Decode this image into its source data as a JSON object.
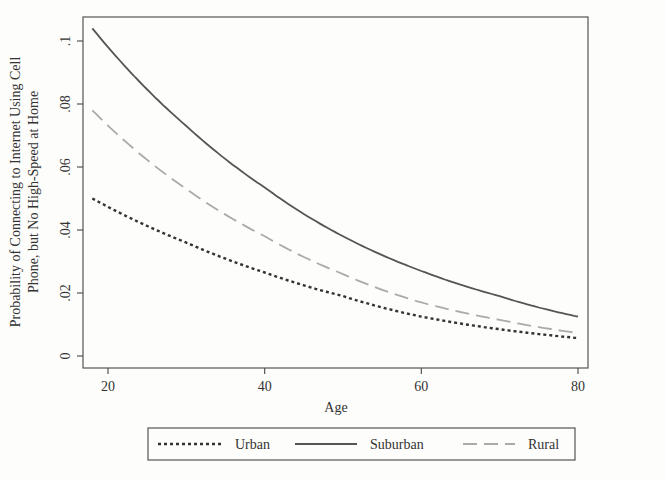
{
  "chart_data": {
    "type": "line",
    "title": "",
    "xlabel": "Age",
    "ylabel_lines": [
      "Probability of Connecting to Internet Using Cell",
      "Phone, but No High-Speed at Home"
    ],
    "ylabel": "Probability of Connecting to Internet Using Cell Phone, but No High-Speed at Home",
    "xlim": [
      18,
      80
    ],
    "ylim": [
      0,
      0.105
    ],
    "x_ticks": [
      20,
      40,
      60,
      80
    ],
    "x_tick_labels": [
      "20",
      "40",
      "60",
      "80"
    ],
    "y_ticks": [
      0,
      0.02,
      0.04,
      0.06,
      0.08,
      0.1
    ],
    "y_tick_labels": [
      "0",
      ".02",
      ".04",
      ".06",
      ".08",
      ".1"
    ],
    "grid": false,
    "legend_position": "bottom",
    "x": [
      18,
      30,
      40,
      50,
      60,
      70,
      80
    ],
    "series": [
      {
        "name": "Urban",
        "style": "dotted",
        "values": [
          0.05,
          0.036,
          0.0265,
          0.019,
          0.0125,
          0.0085,
          0.0057
        ]
      },
      {
        "name": "Suburban",
        "style": "solid",
        "values": [
          0.104,
          0.073,
          0.0535,
          0.038,
          0.027,
          0.019,
          0.0125
        ]
      },
      {
        "name": "Rural",
        "style": "dashed",
        "values": [
          0.078,
          0.053,
          0.038,
          0.026,
          0.017,
          0.0115,
          0.0073
        ]
      }
    ]
  },
  "legend": {
    "items": [
      {
        "label": "Urban"
      },
      {
        "label": "Suburban"
      },
      {
        "label": "Rural"
      }
    ]
  }
}
